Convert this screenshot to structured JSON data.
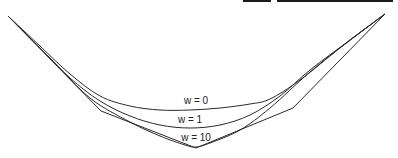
{
  "figure": {
    "top_bars": [
      {
        "x": 243,
        "width": 28
      },
      {
        "x": 277,
        "width": 116
      }
    ],
    "stroke_color": "#2a2a2a",
    "control_polygon": [
      [
        8,
        16
      ],
      [
        101,
        111
      ],
      [
        196,
        148
      ],
      [
        293,
        108
      ],
      [
        385,
        14
      ]
    ],
    "curves": [
      {
        "name": "w=0",
        "points": [
          [
            8,
            16
          ],
          [
            40,
            46
          ],
          [
            70,
            74
          ],
          [
            100,
            96
          ],
          [
            130,
            106
          ],
          [
            160,
            110
          ],
          [
            190,
            110
          ],
          [
            220,
            108
          ],
          [
            250,
            104
          ],
          [
            270,
            99
          ],
          [
            300,
            80
          ],
          [
            340,
            48
          ],
          [
            385,
            14
          ]
        ]
      },
      {
        "name": "w=1",
        "points": [
          [
            8,
            16
          ],
          [
            40,
            48
          ],
          [
            70,
            78
          ],
          [
            100,
            101
          ],
          [
            130,
            116
          ],
          [
            160,
            125
          ],
          [
            190,
            128
          ],
          [
            220,
            125
          ],
          [
            250,
            115
          ],
          [
            280,
            96
          ],
          [
            310,
            70
          ],
          [
            350,
            40
          ],
          [
            385,
            14
          ]
        ]
      },
      {
        "name": "w=10",
        "points": [
          [
            8,
            16
          ],
          [
            50,
            58
          ],
          [
            90,
            98
          ],
          [
            130,
            122
          ],
          [
            160,
            136
          ],
          [
            185,
            145
          ],
          [
            196,
            147
          ],
          [
            210,
            143
          ],
          [
            240,
            130
          ],
          [
            270,
            108
          ],
          [
            310,
            72
          ],
          [
            350,
            40
          ],
          [
            385,
            14
          ]
        ]
      }
    ],
    "labels": [
      {
        "text": "w = 0",
        "x": 196,
        "y": 95
      },
      {
        "text": "w = 1",
        "x": 190,
        "y": 114
      },
      {
        "text": "w = 10",
        "x": 196,
        "y": 132
      }
    ]
  }
}
